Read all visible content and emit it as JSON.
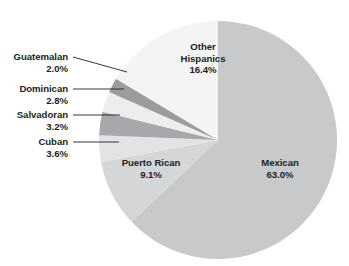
{
  "chart_data": {
    "type": "pie",
    "title": "",
    "subtitle": "",
    "xlabel": "",
    "ylabel": "",
    "legend_position": "none",
    "grid": false,
    "units": "percent",
    "start_angle_deg": 0,
    "direction": "clockwise",
    "categories": [
      "Mexican",
      "Puerto Rican",
      "Cuban",
      "Salvadoran",
      "Dominican",
      "Guatemalan",
      "Other Hispanics"
    ],
    "values": [
      63.0,
      9.1,
      3.6,
      3.2,
      2.8,
      2.0,
      16.4
    ],
    "slices": [
      {
        "label": "Mexican",
        "value": 63.0,
        "value_text": "63.0%",
        "color": "#c8c9cb",
        "label_placement": "inside"
      },
      {
        "label": "Puerto Rican",
        "value": 9.1,
        "value_text": "9.1%",
        "color": "#d5d6d8",
        "label_placement": "inside"
      },
      {
        "label": "Cuban",
        "value": 3.6,
        "value_text": "3.6%",
        "color": "#e2e3e5",
        "label_placement": "callout"
      },
      {
        "label": "Salvadoran",
        "value": 3.2,
        "value_text": "3.2%",
        "color": "#a6a8ab",
        "label_placement": "callout"
      },
      {
        "label": "Dominican",
        "value": 2.8,
        "value_text": "2.8%",
        "color": "#eceded",
        "label_placement": "callout"
      },
      {
        "label": "Guatemalan",
        "value": 2.0,
        "value_text": "2.0%",
        "color": "#9a9c9e",
        "label_placement": "callout"
      },
      {
        "label": "Other Hispanics",
        "value": 16.4,
        "value_text": "16.4%",
        "color": "#f4f4f4",
        "label_placement": "inside"
      }
    ]
  },
  "labels": {
    "callouts": [
      {
        "category": "Guatemalan",
        "percent": "2.0%"
      },
      {
        "category": "Dominican",
        "percent": "2.8%"
      },
      {
        "category": "Salvadoran",
        "percent": "3.2%"
      },
      {
        "category": "Cuban",
        "percent": "3.6%"
      }
    ],
    "inside": [
      {
        "line1": "Other",
        "line2": "Hispanics",
        "percent": "16.4%"
      },
      {
        "line1": "Puerto Rican",
        "line2": "",
        "percent": "9.1%"
      },
      {
        "line1": "Mexican",
        "line2": "",
        "percent": "63.0%"
      }
    ]
  },
  "style": {
    "background": "#ffffff",
    "text_color": "#231f20",
    "leader_line_color": "#231f20",
    "slice_outline": "#ffffff"
  }
}
